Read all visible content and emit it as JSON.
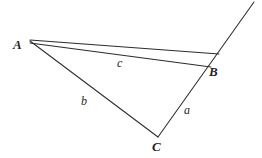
{
  "figure": {
    "type": "geometry-diagram",
    "canvas": {
      "width": 262,
      "height": 158
    },
    "background_color": "#ffffff",
    "stroke_color": "#2b2b2b",
    "vertices": [
      {
        "name": "A",
        "label": "A",
        "x": 30,
        "y": 41,
        "label_x": 13,
        "label_y": 38
      },
      {
        "name": "B",
        "label": "B",
        "x": 212,
        "y": 66,
        "label_x": 209,
        "label_y": 65
      },
      {
        "name": "C",
        "label": "C",
        "x": 158,
        "y": 137,
        "label_x": 152,
        "label_y": 140
      }
    ],
    "sides": [
      {
        "name": "a",
        "label": "a",
        "from": "B",
        "to": "C",
        "label_x": 184,
        "label_y": 104
      },
      {
        "name": "b",
        "label": "b",
        "from": "A",
        "to": "C",
        "label_x": 81,
        "label_y": 95
      },
      {
        "name": "c",
        "label": "c",
        "from": "A",
        "to": "B",
        "label_x": 117,
        "label_y": 57
      }
    ],
    "segments": [
      {
        "name": "segment-a-extended",
        "x1": 158,
        "y1": 137,
        "x2": 254,
        "y2": 2
      },
      {
        "name": "segment-b",
        "x1": 30,
        "y1": 41,
        "x2": 158,
        "y2": 137
      },
      {
        "name": "segment-c-upper",
        "x1": 30,
        "y1": 40,
        "x2": 219,
        "y2": 54
      },
      {
        "name": "segment-c-lower",
        "x1": 30,
        "y1": 43,
        "x2": 211,
        "y2": 67
      }
    ]
  }
}
